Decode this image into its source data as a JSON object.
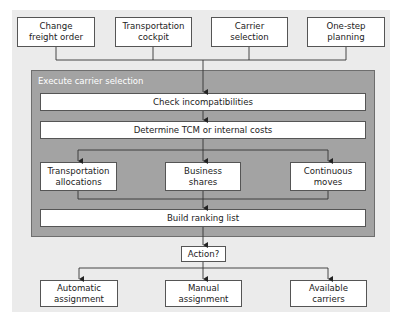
{
  "diagram": {
    "type": "flowchart",
    "colors": {
      "background": "#ebebeb",
      "panel": "#a3a3a3",
      "box_fill": "#ffffff",
      "line": "#333333",
      "panel_title_text": "#ffffff"
    },
    "entry_points": [
      {
        "id": "change-freight-order",
        "label": "Change\nfreight order"
      },
      {
        "id": "transportation-cockpit",
        "label": "Transportation\ncockpit"
      },
      {
        "id": "carrier-selection",
        "label": "Carrier\nselection"
      },
      {
        "id": "one-step-planning",
        "label": "One-step planning"
      }
    ],
    "panel": {
      "title": "Execute carrier selection",
      "steps": [
        {
          "id": "check-incompatibilities",
          "label": "Check incompatibilities"
        },
        {
          "id": "determine-tcm",
          "label": "Determine TCM or internal costs"
        }
      ],
      "strategies": [
        {
          "id": "transportation-allocations",
          "label": "Transportation\nallocations"
        },
        {
          "id": "business-shares",
          "label": "Business\nshares"
        },
        {
          "id": "continuous-moves",
          "label": "Continuous\nmoves"
        }
      ],
      "final_step": {
        "id": "build-ranking-list",
        "label": "Build ranking list"
      }
    },
    "decision": {
      "id": "action",
      "label": "Action?"
    },
    "outcomes": [
      {
        "id": "automatic-assignment",
        "label": "Automatic\nassignment"
      },
      {
        "id": "manual-assignment",
        "label": "Manual\nassignment"
      },
      {
        "id": "available-carriers",
        "label": "Available\ncarriers"
      }
    ],
    "edges": [
      [
        "change-freight-order",
        "check-incompatibilities"
      ],
      [
        "transportation-cockpit",
        "check-incompatibilities"
      ],
      [
        "carrier-selection",
        "check-incompatibilities"
      ],
      [
        "one-step-planning",
        "check-incompatibilities"
      ],
      [
        "check-incompatibilities",
        "determine-tcm"
      ],
      [
        "determine-tcm",
        "transportation-allocations"
      ],
      [
        "determine-tcm",
        "business-shares"
      ],
      [
        "determine-tcm",
        "continuous-moves"
      ],
      [
        "transportation-allocations",
        "build-ranking-list"
      ],
      [
        "business-shares",
        "build-ranking-list"
      ],
      [
        "continuous-moves",
        "build-ranking-list"
      ],
      [
        "build-ranking-list",
        "action"
      ],
      [
        "action",
        "automatic-assignment"
      ],
      [
        "action",
        "manual-assignment"
      ],
      [
        "action",
        "available-carriers"
      ]
    ]
  }
}
